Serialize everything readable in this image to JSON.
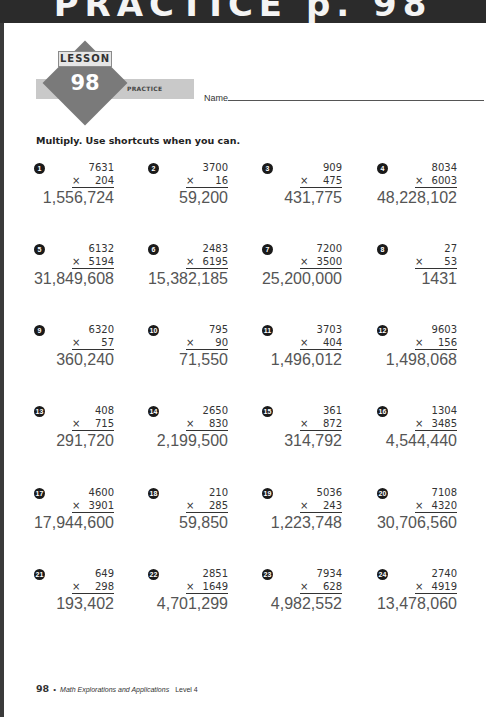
{
  "header": {
    "banner_title": "PRACTICE p. 98"
  },
  "badge": {
    "lesson_label": "LESSON",
    "lesson_number": "98",
    "practice_label": "PRACTICE"
  },
  "name_field": {
    "label": "Name"
  },
  "instructions": "Multiply. Use shortcuts when you can.",
  "problems": [
    {
      "n": "1",
      "a": "7631",
      "b": "204",
      "answer": "1,556,724"
    },
    {
      "n": "2",
      "a": "3700",
      "b": "16",
      "answer": "59,200"
    },
    {
      "n": "3",
      "a": "909",
      "b": "475",
      "answer": "431,775"
    },
    {
      "n": "4",
      "a": "8034",
      "b": "6003",
      "answer": "48,228,102"
    },
    {
      "n": "5",
      "a": "6132",
      "b": "5194",
      "answer": "31,849,608"
    },
    {
      "n": "6",
      "a": "2483",
      "b": "6195",
      "answer": "15,382,185"
    },
    {
      "n": "7",
      "a": "7200",
      "b": "3500",
      "answer": "25,200,000"
    },
    {
      "n": "8",
      "a": "27",
      "b": "53",
      "answer": "1431"
    },
    {
      "n": "9",
      "a": "6320",
      "b": "57",
      "answer": "360,240"
    },
    {
      "n": "10",
      "a": "795",
      "b": "90",
      "answer": "71,550"
    },
    {
      "n": "11",
      "a": "3703",
      "b": "404",
      "answer": "1,496,012"
    },
    {
      "n": "12",
      "a": "9603",
      "b": "156",
      "answer": "1,498,068"
    },
    {
      "n": "13",
      "a": "408",
      "b": "715",
      "answer": "291,720"
    },
    {
      "n": "14",
      "a": "2650",
      "b": "830",
      "answer": "2,199,500"
    },
    {
      "n": "15",
      "a": "361",
      "b": "872",
      "answer": "314,792"
    },
    {
      "n": "16",
      "a": "1304",
      "b": "3485",
      "answer": "4,544,440"
    },
    {
      "n": "17",
      "a": "4600",
      "b": "3901",
      "answer": "17,944,600"
    },
    {
      "n": "18",
      "a": "210",
      "b": "285",
      "answer": "59,850"
    },
    {
      "n": "19",
      "a": "5036",
      "b": "243",
      "answer": "1,223,748"
    },
    {
      "n": "20",
      "a": "7108",
      "b": "4320",
      "answer": "30,706,560"
    },
    {
      "n": "21",
      "a": "649",
      "b": "298",
      "answer": "193,402"
    },
    {
      "n": "22",
      "a": "2851",
      "b": "1649",
      "answer": "4,701,299"
    },
    {
      "n": "23",
      "a": "7934",
      "b": "628",
      "answer": "4,982,552"
    },
    {
      "n": "24",
      "a": "2740",
      "b": "4919",
      "answer": "13,478,060"
    }
  ],
  "times_symbol": "×",
  "footer": {
    "page_number": "98",
    "bullet": "•",
    "book_title": "Math Explorations and Applications",
    "level": "Level 4"
  }
}
